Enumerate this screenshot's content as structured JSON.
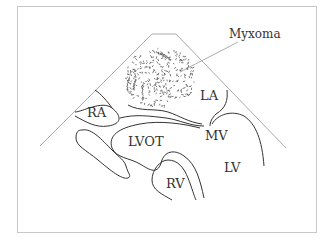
{
  "figure": {
    "labels": {
      "myxoma": "Myxoma",
      "la": "LA",
      "ra": "RA",
      "lvot": "LVOT",
      "mv": "MV",
      "lv": "LV",
      "rv": "RV"
    },
    "colors": {
      "outline": "#333333",
      "sector": "#aaaaaa",
      "frame": "#c8c8c8",
      "stipple": "#555555"
    }
  }
}
